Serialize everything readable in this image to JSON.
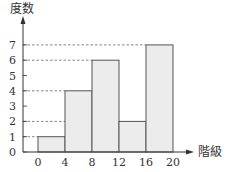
{
  "chart_data": {
    "type": "bar",
    "subtype": "histogram",
    "title": "",
    "xlabel": "階級",
    "ylabel": "度数",
    "bins": [
      [
        0,
        4
      ],
      [
        4,
        8
      ],
      [
        8,
        12
      ],
      [
        12,
        16
      ],
      [
        16,
        20
      ]
    ],
    "categories": [
      "0-4",
      "4-8",
      "8-12",
      "12-16",
      "16-20"
    ],
    "values": [
      1,
      4,
      6,
      2,
      7
    ],
    "x_ticks": [
      0,
      4,
      8,
      12,
      16,
      20
    ],
    "y_ticks": [
      0,
      1,
      2,
      3,
      4,
      5,
      6,
      7
    ],
    "ylim": [
      0,
      7
    ],
    "xlim": [
      0,
      20
    ],
    "grid": false,
    "reference_lines": [
      1,
      2,
      4,
      6,
      7
    ],
    "bar_color": "#ececec",
    "edge_color": "#555555",
    "legend": null
  },
  "labels": {
    "y_axis": "度数",
    "x_axis": "階級"
  }
}
